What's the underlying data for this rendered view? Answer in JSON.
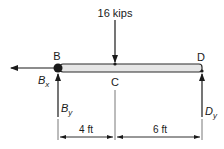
{
  "diagram": {
    "type": "free-body diagram",
    "beam": {
      "label_left": "B",
      "label_mid": "C",
      "label_right": "D",
      "fill": "#e6e6e6",
      "stroke": "#2a2a2a"
    },
    "load": {
      "label": "16 kips",
      "direction": "down",
      "point": "C"
    },
    "reactions": [
      {
        "id": "bx",
        "label_main": "B",
        "label_sub": "x",
        "direction": "left",
        "point": "B"
      },
      {
        "id": "by",
        "label_main": "B",
        "label_sub": "y",
        "direction": "up",
        "point": "B"
      },
      {
        "id": "dy",
        "label_main": "D",
        "label_sub": "y",
        "direction": "up",
        "point": "D"
      }
    ],
    "dimensions": [
      {
        "label": "4 ft",
        "from": "B",
        "to": "C"
      },
      {
        "label": "6 ft",
        "from": "C",
        "to": "D"
      }
    ]
  }
}
